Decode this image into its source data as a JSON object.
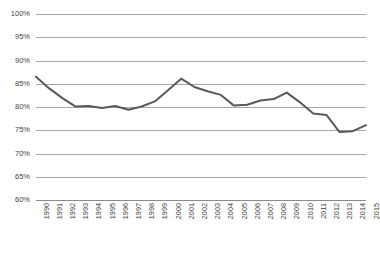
{
  "title": {
    "text": "cropped title (illegible)",
    "visible_fragment": ""
  },
  "chart_data": {
    "type": "line",
    "title": "",
    "xlabel": "",
    "ylabel": "",
    "ylim": [
      60,
      100
    ],
    "ytick_step": 5,
    "ytick_labels": [
      "100%",
      "95%",
      "90%",
      "85%",
      "80%",
      "75%",
      "70%",
      "65%",
      "60%"
    ],
    "ytick_values": [
      100,
      95,
      90,
      85,
      80,
      75,
      70,
      65,
      60
    ],
    "grid": true,
    "grid_axis": "y",
    "legend": false,
    "legend_position": "none",
    "markers": false,
    "categories": [
      "1990",
      "1991",
      "1992",
      "1993",
      "1994",
      "1995",
      "1996",
      "1997",
      "1998",
      "1999",
      "2000",
      "2001",
      "2002",
      "2003",
      "2004",
      "2005",
      "2006",
      "2007",
      "2008",
      "2009",
      "2010",
      "2011",
      "2012",
      "2013",
      "2014",
      "2015"
    ],
    "values": [
      86.5,
      84.0,
      81.9,
      80.1,
      80.2,
      79.8,
      80.2,
      79.4,
      80.1,
      81.2,
      83.6,
      86.1,
      84.3,
      83.4,
      82.6,
      80.3,
      80.5,
      81.4,
      81.7,
      83.1,
      81.0,
      78.6,
      78.3,
      74.6,
      74.8,
      76.1
    ],
    "series": [
      {
        "name": "series-1",
        "color": "#595959",
        "values": [
          86.5,
          84.0,
          81.9,
          80.1,
          80.2,
          79.8,
          80.2,
          79.4,
          80.1,
          81.2,
          83.6,
          86.1,
          84.3,
          83.4,
          82.6,
          80.3,
          80.5,
          81.4,
          81.7,
          83.1,
          81.0,
          78.6,
          78.3,
          74.6,
          74.8,
          76.1
        ]
      }
    ]
  },
  "colors": {
    "line": "#595959",
    "gridline": "#a8a8a8",
    "axis": "#8a8a8a",
    "text": "#3f3f3f",
    "background": "#ffffff"
  }
}
